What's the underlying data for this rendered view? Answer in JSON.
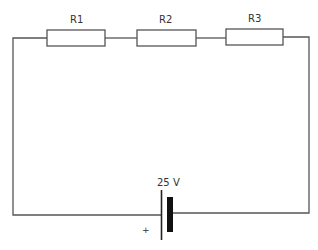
{
  "diagram": {
    "type": "series circuit",
    "resistors": [
      {
        "label": "R1"
      },
      {
        "label": "R2"
      },
      {
        "label": "R3"
      }
    ],
    "battery": {
      "label": "25 V",
      "positive_marker": "+"
    }
  }
}
